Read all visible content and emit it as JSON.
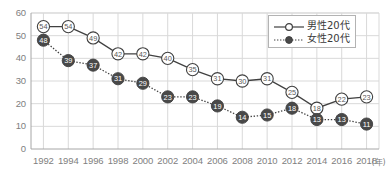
{
  "chart_data": {
    "type": "line",
    "title": "",
    "xlabel": "(年)",
    "ylabel": "",
    "x": [
      1992,
      1994,
      1996,
      1998,
      2000,
      2002,
      2004,
      2006,
      2008,
      2010,
      2012,
      2014,
      2016,
      2018
    ],
    "xtick_labels": [
      "1992",
      "1994",
      "1996",
      "1998",
      "2000",
      "2002",
      "2004",
      "2006",
      "2008",
      "2010",
      "2012",
      "2014",
      "2016",
      "2018"
    ],
    "xlim": [
      1991,
      2019
    ],
    "ylim": [
      0,
      60
    ],
    "ytick_labels": [
      "0",
      "10",
      "20",
      "30",
      "40",
      "50",
      "60"
    ],
    "yticks": [
      0,
      10,
      20,
      30,
      40,
      50,
      60
    ],
    "grid": true,
    "legend_position": "top-right",
    "series": [
      {
        "name": "男性20代",
        "marker": "open-circle",
        "line_style": "solid",
        "color": "#404040",
        "marker_fill": "#ffffff",
        "values": [
          54,
          54,
          49,
          42,
          42,
          40,
          35,
          31,
          30,
          31,
          25,
          18,
          22,
          23
        ]
      },
      {
        "name": "女性20代",
        "marker": "filled-circle",
        "line_style": "dotted",
        "color": "#404040",
        "marker_fill": "#494949",
        "values": [
          48,
          39,
          37,
          31,
          29,
          23,
          23,
          19,
          14,
          15,
          18,
          13,
          13,
          11
        ]
      }
    ]
  },
  "legend": {
    "items": [
      {
        "label": "男性20代"
      },
      {
        "label": "女性20代"
      }
    ]
  },
  "axis": {
    "x_unit_label": "(年)"
  }
}
